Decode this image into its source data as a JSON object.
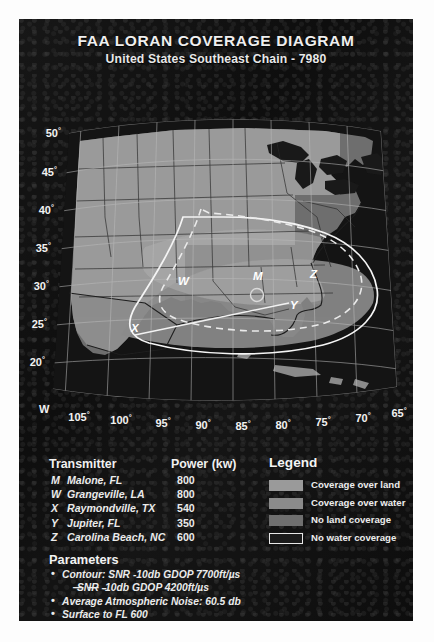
{
  "title": {
    "line1": "FAA LORAN COVERAGE DIAGRAM",
    "line2": "United States Southeast Chain - 7980"
  },
  "map": {
    "hemisphere_label": "W",
    "latitude_labels": [
      "50",
      "45",
      "40",
      "35",
      "30",
      "25",
      "20"
    ],
    "longitude_labels": [
      "105",
      "100",
      "95",
      "90",
      "85",
      "80",
      "75",
      "70",
      "65"
    ],
    "degree_symbol": "°",
    "transmitter_markers": [
      {
        "code": "W",
        "x": 153,
        "y": 188
      },
      {
        "code": "M",
        "x": 228,
        "y": 183
      },
      {
        "code": "Z",
        "x": 285,
        "y": 181
      },
      {
        "code": "Y",
        "x": 265,
        "y": 212
      },
      {
        "code": "X",
        "x": 106,
        "y": 235
      }
    ]
  },
  "table": {
    "header_name": "Transmitter",
    "header_power": "Power (kw)",
    "rows": [
      {
        "code": "M",
        "name": "Malone, FL",
        "power": "800"
      },
      {
        "code": "W",
        "name": "Grangeville, LA",
        "power": "800"
      },
      {
        "code": "X",
        "name": "Raymondville, TX",
        "power": "540"
      },
      {
        "code": "Y",
        "name": "Jupiter, FL",
        "power": "350"
      },
      {
        "code": "Z",
        "name": "Carolina Beach, NC",
        "power": "600"
      }
    ]
  },
  "parameters": {
    "title": "Parameters",
    "bullet_glyph": "•",
    "dash_glyph": "—  —   -",
    "items": [
      {
        "type": "bullet",
        "text": "Contour: SNR -10db GDOP 7700ft/µs"
      },
      {
        "type": "dash",
        "text": "SNR -10db GDOP 4200ft/µs"
      },
      {
        "type": "bullet",
        "text": "Average Atmospheric Noise: 60.5 db"
      },
      {
        "type": "bullet",
        "text": "Surface to FL 600"
      },
      {
        "type": "bullet",
        "text": "Flight verified"
      }
    ]
  },
  "legend": {
    "title": "Legend",
    "items": [
      {
        "label": "Coverage over land",
        "color": "#9a9a9a",
        "border": "none"
      },
      {
        "label": "Coverage over water",
        "color": "#8b8b8b",
        "border": "none"
      },
      {
        "label": "No land coverage",
        "color": "#6f6f6f",
        "border": "none"
      },
      {
        "label": "No water coverage",
        "color": "#1b1b1b",
        "border": "#e8e8e8"
      }
    ]
  },
  "colors": {
    "poster_background": "#131313",
    "page_background": "#fdfdfd",
    "coverage_land": "#9a9a9a",
    "coverage_water": "#8b8b8b",
    "no_land_coverage": "#6f6f6f",
    "no_water_coverage": "#1b1b1b",
    "contour_solid": "#f2f2f2",
    "contour_dashed": "#e6e6e6",
    "text": "#eeeeee"
  }
}
